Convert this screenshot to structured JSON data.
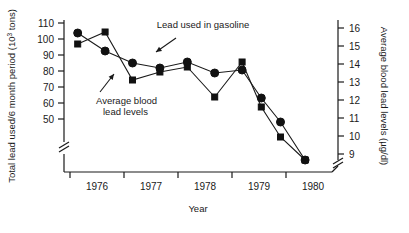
{
  "chart_data": {
    "type": "line",
    "title": "",
    "xlabel": "Year",
    "ylabel_left": "Total lead used/6 month period (10³ tons)",
    "ylabel_right": "Average blood lead levels (µg/dl)",
    "grid": false,
    "legend_position": "inline-annotations",
    "xlim": [
      1975.5,
      1980.5
    ],
    "xticklabels": [
      "1976",
      "1977",
      "1978",
      "1979",
      "1980"
    ],
    "xtickvalues": [
      1976,
      1977,
      1978,
      1979,
      1980
    ],
    "ylim_left": [
      45,
      112
    ],
    "yticklabels_left": [
      "110",
      "100",
      "90",
      "80",
      "70",
      "60",
      "50"
    ],
    "ytickvalues_left": [
      110,
      100,
      90,
      80,
      70,
      60,
      50
    ],
    "ylim_right": [
      8.7,
      16.6
    ],
    "yticklabels_right": [
      "16",
      "15",
      "14",
      "13",
      "12",
      "11",
      "10",
      "9"
    ],
    "ytickvalues_right": [
      16,
      15,
      14,
      13,
      12,
      11,
      10,
      9
    ],
    "axis_break_left": true,
    "axis_break_bottom_right": true,
    "annotations": [
      {
        "text": "Lead used in gasoline",
        "x": 203,
        "y": 28,
        "anchor": "middle"
      },
      {
        "text": "Average blood",
        "x": 96,
        "y": 104,
        "anchor": "start"
      },
      {
        "text": "lead levels",
        "x": 103,
        "y": 115,
        "anchor": "start"
      }
    ],
    "arrows": [
      {
        "x1": 176,
        "y1": 38,
        "x2": 156,
        "y2": 52
      },
      {
        "x1": 100,
        "y1": 92,
        "x2": 114,
        "y2": 74
      }
    ],
    "series": [
      {
        "name": "Lead used in gasoline",
        "marker": "square",
        "axis": "left",
        "points": [
          {
            "x": 1975.75,
            "y_px": 44,
            "value": 102
          },
          {
            "x": 1976.25,
            "y_px": 32,
            "value": 107
          },
          {
            "x": 1976.75,
            "y_px": 80,
            "value": 86
          },
          {
            "x": 1977.25,
            "y_px": 72,
            "value": 91
          },
          {
            "x": 1977.75,
            "y_px": 67,
            "value": 93
          },
          {
            "x": 1978.25,
            "y_px": 97,
            "value": 78
          },
          {
            "x": 1978.75,
            "y_px": 62,
            "value": 95
          },
          {
            "x": 1979.1,
            "y_px": 107,
            "value": 75
          },
          {
            "x": 1979.45,
            "y_px": 137,
            "value": 62
          },
          {
            "x": 1979.9,
            "y_px": 160,
            "value": 47
          }
        ]
      },
      {
        "name": "Average blood lead levels",
        "marker": "circle",
        "axis": "right",
        "points": [
          {
            "x": 1975.75,
            "y_px": 33,
            "value": 16.1
          },
          {
            "x": 1976.25,
            "y_px": 51,
            "value": 15.2
          },
          {
            "x": 1976.75,
            "y_px": 63,
            "value": 14.5
          },
          {
            "x": 1977.25,
            "y_px": 68,
            "value": 14.3
          },
          {
            "x": 1977.75,
            "y_px": 62,
            "value": 14.6
          },
          {
            "x": 1978.25,
            "y_px": 73,
            "value": 14.0
          },
          {
            "x": 1978.75,
            "y_px": 70,
            "value": 14.2
          },
          {
            "x": 1979.1,
            "y_px": 98,
            "value": 12.7
          },
          {
            "x": 1979.45,
            "y_px": 122,
            "value": 11.5
          },
          {
            "x": 1979.9,
            "y_px": 160,
            "value": 9.6
          }
        ]
      }
    ]
  },
  "figure": {
    "x_axis_title": "Year",
    "y_left_title_main": "Total lead used/6 month period (10",
    "y_left_title_sup": "3",
    "y_left_title_tail": " tons)",
    "y_right_title": "Average blood lead levels (µg/dl)"
  }
}
